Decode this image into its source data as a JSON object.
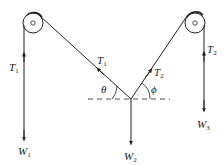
{
  "diagram": {
    "type": "physics-free-body",
    "colors": {
      "line": "#222222",
      "background": "#ffffff"
    },
    "pulleys": [
      {
        "id": "left-pulley",
        "cx": 33,
        "cy": 23,
        "r": 10
      },
      {
        "id": "right-pulley",
        "cx": 195,
        "cy": 23,
        "r": 10
      }
    ],
    "labels": {
      "T1_left": {
        "base": "T",
        "sub": "1"
      },
      "T1_diag": {
        "base": "T",
        "sub": "1"
      },
      "T2_diag": {
        "base": "T",
        "sub": "2"
      },
      "T2_right": {
        "base": "T",
        "sub": "2"
      },
      "theta": "θ",
      "phi": "ϕ",
      "W1": {
        "base": "W",
        "sub": "1"
      },
      "W2": {
        "base": "W",
        "sub": "2"
      },
      "W3": {
        "base": "W",
        "sub": "3"
      }
    }
  }
}
